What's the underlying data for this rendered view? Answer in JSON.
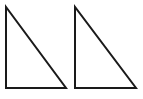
{
  "figure": {
    "background_color": "#ffffff",
    "width": 143,
    "height": 99,
    "stroke_color": "#1a1a1a",
    "stroke_width": 2,
    "shape_count": "2",
    "shapes": [
      {
        "name": "triangle-left",
        "label": "Triangle 1",
        "type": "right-triangle",
        "right_angle_vertex": "bottom-left",
        "points": "6,7 6,88 66,88",
        "vertices": {
          "apex": "6,7",
          "bottom_left": "6,88",
          "bottom_right": "66,88"
        },
        "vertical_leg_length": 81,
        "horizontal_leg_length": 60
      },
      {
        "name": "triangle-right",
        "label": "Triangle 2",
        "type": "right-triangle",
        "right_angle_vertex": "bottom-left",
        "points": "75,7 75,88 136,88",
        "vertices": {
          "apex": "75,7",
          "bottom_left": "75,88",
          "bottom_right": "136,88"
        },
        "vertical_leg_length": 81,
        "horizontal_leg_length": 61
      }
    ]
  }
}
